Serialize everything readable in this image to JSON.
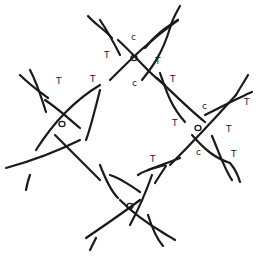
{
  "diagram": {
    "type": "knot-diagram",
    "nodes": [
      {
        "id": "top",
        "label": "o",
        "x": 134,
        "y": 58
      },
      {
        "id": "left",
        "label": "o",
        "x": 62,
        "y": 124
      },
      {
        "id": "right",
        "label": "o",
        "x": 198,
        "y": 128
      },
      {
        "id": "bottom",
        "label": "o",
        "x": 130,
        "y": 206
      }
    ],
    "labels": [
      {
        "text": "c",
        "x": 131,
        "y": 40
      },
      {
        "text": "T",
        "x": 108,
        "y": 56
      },
      {
        "text": "T",
        "x": 157,
        "y": 64
      },
      {
        "text": "c",
        "x": 132,
        "y": 85
      },
      {
        "text": "T",
        "x": 93,
        "y": 80
      },
      {
        "text": "T",
        "x": 172,
        "y": 80
      },
      {
        "text": "T",
        "x": 54,
        "y": 83
      },
      {
        "text": "c",
        "x": 204,
        "y": 107
      },
      {
        "text": "T",
        "x": 245,
        "y": 103
      },
      {
        "text": "T",
        "x": 172,
        "y": 124
      },
      {
        "text": "T",
        "x": 228,
        "y": 130
      },
      {
        "text": "c",
        "x": 198,
        "y": 153
      },
      {
        "text": "T",
        "x": 232,
        "y": 155
      },
      {
        "text": "T",
        "x": 152,
        "y": 160
      }
    ]
  }
}
